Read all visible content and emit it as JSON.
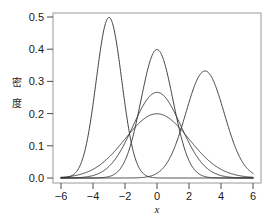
{
  "chart_data": {
    "type": "line",
    "title": "",
    "xlabel": "x",
    "ylabel": "密度",
    "xlim": [
      -6,
      6
    ],
    "ylim": [
      0.0,
      0.5
    ],
    "xticks": [
      -6,
      -4,
      -2,
      0,
      2,
      4,
      6
    ],
    "xtick_labels": [
      "−6",
      "−4",
      "−2",
      "0",
      "2",
      "4",
      "6"
    ],
    "yticks": [
      0.0,
      0.1,
      0.2,
      0.3,
      0.4,
      0.5
    ],
    "ytick_labels": [
      "0.0",
      "0.1",
      "0.2",
      "0.3",
      "0.4",
      "0.5"
    ],
    "grid": false,
    "legend": "none",
    "series": [
      {
        "name": "normal-mu-neg3-sigma-0.8",
        "distribution": "normal",
        "mean": -3,
        "sd": 0.8,
        "peak_x": -3,
        "peak_y": 0.4987,
        "color": "#2b2b2b"
      },
      {
        "name": "normal-mu-0-sigma-1",
        "distribution": "normal",
        "mean": 0,
        "sd": 1.0,
        "peak_x": 0,
        "peak_y": 0.3989,
        "color": "#2b2b2b"
      },
      {
        "name": "normal-mu-3-sigma-1.2",
        "distribution": "normal",
        "mean": 3,
        "sd": 1.2,
        "peak_x": 3,
        "peak_y": 0.3324,
        "color": "#2b2b2b"
      },
      {
        "name": "normal-mu-0-sigma-1.5",
        "distribution": "normal",
        "mean": 0,
        "sd": 1.5,
        "peak_x": 0,
        "peak_y": 0.266,
        "color": "#2b2b2b"
      },
      {
        "name": "normal-mu-0-sigma-2",
        "distribution": "normal",
        "mean": 0,
        "sd": 2.0,
        "peak_x": 0,
        "peak_y": 0.1995,
        "color": "#2b2b2b"
      }
    ]
  },
  "axis": {
    "y_title_chars": [
      "密",
      "度"
    ],
    "x_title": "x"
  },
  "style": {
    "curve_color": "#2b2b2b",
    "border_color": "#9a9a9a",
    "tick_color": "#4a4a4a",
    "text_color": "#1a1a1a",
    "background": "#ffffff"
  }
}
